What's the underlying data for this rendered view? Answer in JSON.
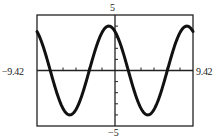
{
  "chart_data": {
    "type": "line",
    "title": "",
    "xlabel": "",
    "ylabel": "",
    "xlim": [
      -9.42,
      9.42
    ],
    "ylim": [
      -5,
      5
    ],
    "x_tick_labels": {
      "min": "−9.42",
      "max": "9.42"
    },
    "y_tick_labels": {
      "min": "−5",
      "max": "5"
    },
    "x_tick_step": 1.57,
    "y_tick_step": 1,
    "grid": false,
    "legend": null,
    "series": [
      {
        "name": "y = 4cos(2x/3 + 0.5)",
        "amplitude": 4,
        "angular_frequency": 0.6667,
        "phase": 0.5,
        "x": [
          -9.42,
          -7.85,
          -6.28,
          -4.71,
          -3.14,
          -1.57,
          -0.75,
          0,
          1.57,
          3.14,
          3.96,
          4.71,
          6.28,
          7.85,
          8.67,
          9.42
        ],
        "y": [
          3.5,
          1.6,
          -1.9,
          -4.0,
          -2.3,
          1.9,
          4.0,
          3.5,
          0.3,
          -3.2,
          -4.0,
          -3.6,
          0.6,
          3.9,
          4.0,
          3.5
        ]
      }
    ]
  },
  "colors": {
    "curve": "#111111",
    "axes": "#222222",
    "background": "#ffffff"
  }
}
